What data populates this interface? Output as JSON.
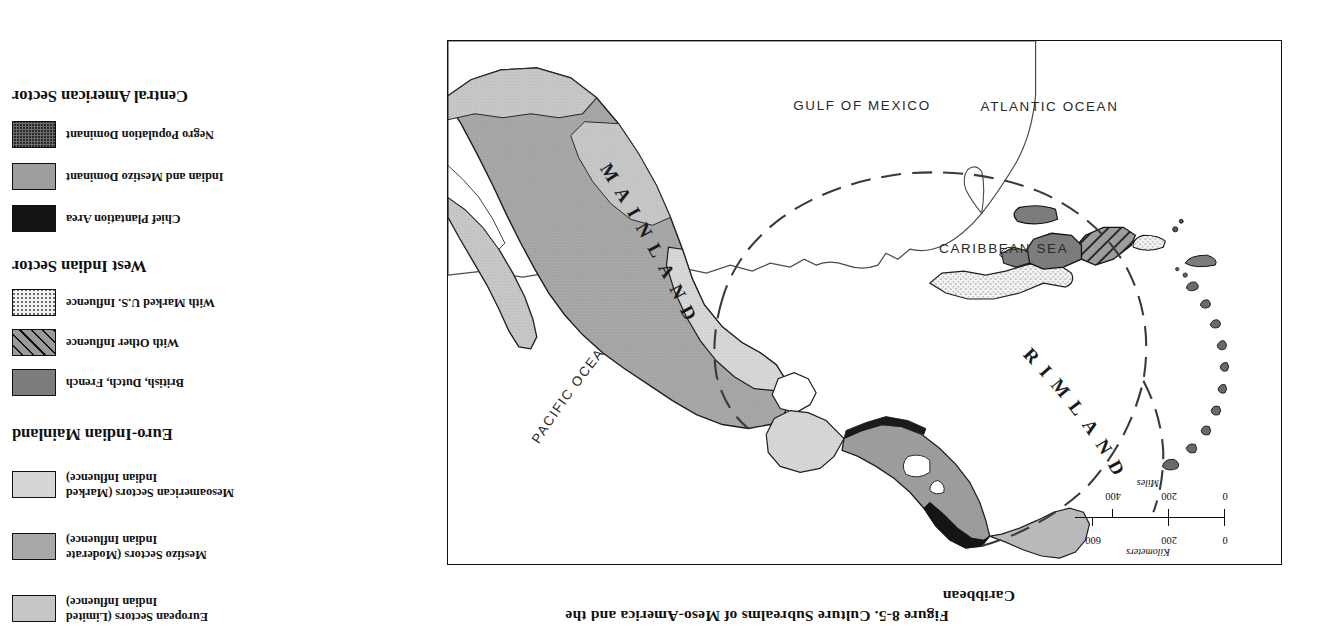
{
  "figure": {
    "title_line1": "Figure 8-5.  Culture Subrealms of Meso-America and the",
    "title_line2": "Caribbean"
  },
  "map": {
    "scale": {
      "km_caption": "Kilometers",
      "km_labels": [
        "0",
        "200",
        "600"
      ],
      "mi_caption": "Miles",
      "mi_labels": [
        "0",
        "200",
        "400"
      ]
    },
    "labels": {
      "atlantic": "ATLANTIC  OCEAN",
      "pacific": "PACIFIC  OCEAN",
      "gulf": "GULF OF MEXICO",
      "caribbean_sea": "CARIBBEAN SEA",
      "mainland": "MAINLAND",
      "rimland": "RIMLAND"
    }
  },
  "legend": {
    "sections": [
      {
        "heading": "Central American Sector",
        "items": [
          {
            "label_line1": "Negro Population Dominant",
            "label_line2": "",
            "swatch": "negro-stipple",
            "color": "#6d6d6d"
          },
          {
            "label_line1": "Indian and Mestizo Dominant",
            "label_line2": "",
            "swatch": "mid-gray",
            "color": "#9e9e9e"
          },
          {
            "label_line1": "Chief Plantation Area",
            "label_line2": "",
            "swatch": "solid-black",
            "color": "#141414"
          }
        ]
      },
      {
        "heading": "West Indian Sector",
        "items": [
          {
            "label_line1": "With Marked U.S. Influence",
            "label_line2": "",
            "swatch": "light-stipple",
            "color": "#f2f2f2"
          },
          {
            "label_line1": "With Other Influence",
            "label_line2": "",
            "swatch": "diagonal-hatch",
            "color": "#9a9a9a"
          },
          {
            "label_line1": "British, Dutch, French",
            "label_line2": "",
            "swatch": "dark-gray",
            "color": "#7c7c7c"
          }
        ]
      },
      {
        "heading": "Euro-Indian Mainland",
        "items": [
          {
            "label_line1": "Mesoamerican  Sectors (Marked",
            "label_line2": "Indian Influence)",
            "swatch": "light-gray",
            "color": "#d6d6d6"
          },
          {
            "label_line1": "Mestizo Sectors (Moderate",
            "label_line2": "Indian Influence)",
            "swatch": "medium-gray",
            "color": "#a8a8a8"
          },
          {
            "label_line1": "European Sectors (Limited",
            "label_line2": "Indian Influence)",
            "swatch": "lighter-gray",
            "color": "#c6c6c6"
          }
        ]
      }
    ]
  }
}
